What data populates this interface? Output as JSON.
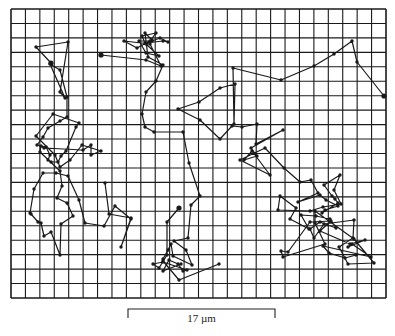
{
  "figure": {
    "grid": {
      "x0": 11,
      "y0": 9,
      "x1": 386,
      "y1": 298,
      "cols": 26,
      "rows": 20,
      "color": "#1a1a1a"
    },
    "line_color": "#1a1a1a",
    "scale_bar": {
      "label": "17 µm",
      "x0": 128,
      "x1": 275,
      "y": 309,
      "tick": 9
    },
    "trajectories": [
      {
        "name": "trajectory-1",
        "points": [
          [
            51,
            63
          ],
          [
            36,
            47
          ],
          [
            68,
            42
          ],
          [
            60,
            92
          ],
          [
            65,
            98
          ],
          [
            50,
            64
          ],
          [
            60,
            70
          ],
          [
            67,
            97
          ],
          [
            67,
            117
          ],
          [
            60,
            121
          ],
          [
            48,
            128
          ],
          [
            43,
            137
          ],
          [
            37,
            145
          ],
          [
            46,
            147
          ],
          [
            50,
            155
          ],
          [
            48,
            160
          ],
          [
            51,
            162
          ],
          [
            58,
            162
          ],
          [
            61,
            156
          ],
          [
            66,
            151
          ],
          [
            76,
            127
          ],
          [
            79,
            123
          ],
          [
            53,
            114
          ],
          [
            36,
            136
          ],
          [
            55,
            155
          ],
          [
            60,
            167
          ],
          [
            70,
            160
          ],
          [
            82,
            145
          ],
          [
            101,
            151
          ],
          [
            91,
            155
          ],
          [
            91,
            145
          ],
          [
            83,
            150
          ],
          [
            44,
            148
          ],
          [
            41,
            146
          ],
          [
            40,
            152
          ],
          [
            60,
            171
          ],
          [
            62,
            186
          ],
          [
            57,
            198
          ],
          [
            67,
            203
          ],
          [
            73,
            216
          ],
          [
            61,
            224
          ],
          [
            60,
            255
          ],
          [
            51,
            232
          ],
          [
            44,
            236
          ],
          [
            41,
            223
          ],
          [
            38,
            222
          ],
          [
            31,
            214
          ],
          [
            30,
            213
          ],
          [
            34,
            189
          ],
          [
            43,
            173
          ],
          [
            56,
            173
          ],
          [
            68,
            176
          ],
          [
            79,
            200
          ],
          [
            85,
            223
          ],
          [
            104,
            226
          ],
          [
            115,
            206
          ],
          [
            131,
            219
          ],
          [
            121,
            247
          ],
          [
            131,
            218
          ],
          [
            109,
            214
          ],
          [
            105,
            183
          ]
        ]
      },
      {
        "name": "trajectory-2",
        "points": [
          [
            101,
            55
          ],
          [
            146,
            60
          ],
          [
            161,
            66
          ],
          [
            150,
            44
          ],
          [
            124,
            41
          ],
          [
            137,
            48
          ],
          [
            150,
            41
          ],
          [
            156,
            33
          ],
          [
            142,
            36
          ],
          [
            145,
            43
          ],
          [
            163,
            41
          ],
          [
            168,
            42
          ],
          [
            160,
            38
          ],
          [
            152,
            41
          ],
          [
            139,
            41
          ],
          [
            146,
            53
          ],
          [
            159,
            56
          ],
          [
            146,
            44
          ],
          [
            152,
            40
          ],
          [
            145,
            33
          ],
          [
            148,
            57
          ],
          [
            163,
            65
          ],
          [
            156,
            81
          ],
          [
            146,
            92
          ],
          [
            142,
            114
          ],
          [
            145,
            127
          ],
          [
            154,
            132
          ],
          [
            183,
            132
          ],
          [
            189,
            163
          ],
          [
            200,
            196
          ],
          [
            191,
            205
          ],
          [
            188,
            238
          ],
          [
            174,
            241
          ],
          [
            186,
            250
          ],
          [
            192,
            265
          ],
          [
            173,
            256
          ],
          [
            171,
            244
          ],
          [
            168,
            250
          ],
          [
            163,
            259
          ],
          [
            163,
            261
          ],
          [
            179,
            280
          ],
          [
            219,
            264
          ]
        ]
      },
      {
        "name": "trajectory-3",
        "points": [
          [
            179,
            208
          ],
          [
            167,
            222
          ],
          [
            167,
            255
          ],
          [
            159,
            268
          ],
          [
            153,
            264
          ],
          [
            163,
            262
          ],
          [
            187,
            270
          ],
          [
            183,
            271
          ],
          [
            178,
            264
          ],
          [
            169,
            260
          ],
          [
            163,
            271
          ],
          [
            181,
            264
          ]
        ]
      },
      {
        "name": "trajectory-4",
        "points": [
          [
            384,
            96
          ],
          [
            357,
            62
          ],
          [
            352,
            41
          ],
          [
            334,
            54
          ],
          [
            314,
            66
          ],
          [
            281,
            80
          ],
          [
            233,
            68
          ],
          [
            234,
            124
          ],
          [
            235,
            84
          ],
          [
            220,
            88
          ],
          [
            199,
            102
          ],
          [
            178,
            109
          ],
          [
            200,
            120
          ],
          [
            220,
            139
          ],
          [
            232,
            126
          ],
          [
            242,
            127
          ],
          [
            257,
            124
          ],
          [
            256,
            144
          ],
          [
            283,
            130
          ],
          [
            251,
            148
          ],
          [
            257,
            156
          ],
          [
            244,
            160
          ],
          [
            252,
            151
          ],
          [
            270,
            175
          ],
          [
            240,
            160
          ],
          [
            265,
            148
          ],
          [
            284,
            168
          ],
          [
            300,
            182
          ],
          [
            311,
            180
          ],
          [
            318,
            193
          ],
          [
            298,
            202
          ],
          [
            320,
            195
          ],
          [
            326,
            200
          ],
          [
            338,
            206
          ],
          [
            325,
            210
          ],
          [
            322,
            213
          ],
          [
            338,
            203
          ],
          [
            335,
            199
          ],
          [
            332,
            196
          ],
          [
            324,
            185
          ],
          [
            340,
            175
          ],
          [
            334,
            190
          ],
          [
            341,
            204
          ],
          [
            323,
            207
          ],
          [
            310,
            211
          ],
          [
            278,
            210
          ],
          [
            280,
            196
          ],
          [
            296,
            208
          ],
          [
            290,
            219
          ],
          [
            309,
            229
          ],
          [
            301,
            215
          ],
          [
            316,
            216
          ],
          [
            330,
            219
          ],
          [
            336,
            228
          ],
          [
            320,
            222
          ],
          [
            310,
            229
          ],
          [
            314,
            238
          ],
          [
            324,
            224
          ],
          [
            354,
            220
          ],
          [
            353,
            238
          ],
          [
            339,
            247
          ],
          [
            348,
            264
          ],
          [
            374,
            263
          ],
          [
            354,
            239
          ],
          [
            315,
            211
          ],
          [
            315,
            223
          ],
          [
            325,
            244
          ],
          [
            283,
            257
          ],
          [
            281,
            251
          ],
          [
            288,
            252
          ],
          [
            310,
            222
          ],
          [
            331,
            221
          ],
          [
            320,
            231
          ],
          [
            350,
            244
          ],
          [
            365,
            240
          ],
          [
            348,
            247
          ],
          [
            352,
            244
          ],
          [
            371,
            257
          ],
          [
            323,
            246
          ],
          [
            329,
            253
          ],
          [
            345,
            258
          ],
          [
            356,
            255
          ]
        ]
      }
    ]
  }
}
